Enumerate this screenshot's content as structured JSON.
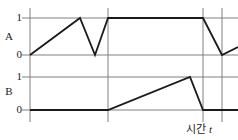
{
  "figure": {
    "kind": "timing-diagram",
    "background_color": "#ffffff",
    "line_color": "#1a1a1a",
    "grid_color": "#808080"
  },
  "axes": {
    "x_axis_label_text": "시간",
    "x_axis_label_variable": "t",
    "panel_a": {
      "signal_name": "A",
      "tick_high": "1",
      "tick_low": "0"
    },
    "panel_b": {
      "signal_name": "B",
      "tick_high": "1",
      "tick_low": "0"
    }
  },
  "chart_data": {
    "type": "line",
    "title": "",
    "xlabel": "시간 t",
    "ylabel": "",
    "grid": true,
    "legend": "none",
    "xlim": [
      0,
      1
    ],
    "vertical_gridlines": [
      0.0,
      0.405,
      0.9,
      1.0
    ],
    "series": [
      {
        "name": "A",
        "ylabel": "A",
        "ylim": [
          0,
          1
        ],
        "yticks": [
          0,
          1
        ],
        "x": [
          0.0,
          0.26,
          0.34,
          0.405,
          0.9,
          1.0,
          1.08
        ],
        "values": [
          0,
          1,
          0,
          1,
          1,
          0,
          0.25
        ]
      },
      {
        "name": "B",
        "ylabel": "B",
        "ylim": [
          0,
          1
        ],
        "yticks": [
          0,
          1
        ],
        "x": [
          0.0,
          0.405,
          0.83,
          0.9,
          1.08
        ],
        "values": [
          0,
          0,
          1,
          0,
          0
        ]
      }
    ]
  },
  "geometry": {
    "plot_left_px": 30,
    "plot_right_px": 238,
    "a_high_y_px": 18,
    "a_low_y_px": 55,
    "b_high_y_px": 77,
    "b_low_y_px": 110,
    "vline_x_px": [
      30,
      108,
      203,
      222
    ],
    "signal_a_points_px": "30,55 80,18 95,55 108,18 203,18 222,55 238,47",
    "signal_b_points_px": "30,110 108,110 190,77 203,110 238,110"
  }
}
